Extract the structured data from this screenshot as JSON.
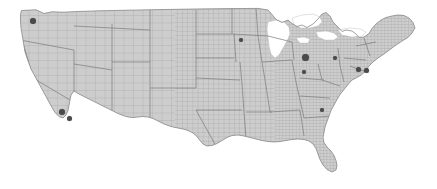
{
  "map": {
    "title": "United States county map",
    "region": "Contiguous United States",
    "background_color": "#ffffff",
    "land_fill_color": "#cccccc",
    "county_border_color": "#9a9a9a",
    "state_border_color": "#7d7d7d",
    "lake_fill_color": "#ffffff",
    "marker_color": "#4a4a4a",
    "marker_label": "city-marker",
    "units": "pixels",
    "width": 437,
    "height": 189
  },
  "chart_data": {
    "type": "scatter",
    "subtitle": "",
    "xlabel": "",
    "ylabel": "",
    "projection": "albers-usa",
    "grid": false,
    "legend": false,
    "basemap": {
      "name": "US counties",
      "fill": "#cccccc",
      "stroke": "#9a9a9a"
    },
    "point_color": "#4a4a4a",
    "points": [
      {
        "name": "Seattle",
        "state": "WA",
        "x": 33,
        "y": 21,
        "size": 6
      },
      {
        "name": "Los Angeles",
        "state": "CA",
        "x": 62,
        "y": 112,
        "size": 6
      },
      {
        "name": "San Diego",
        "state": "CA",
        "x": 69,
        "y": 118,
        "size": 5
      },
      {
        "name": "Minneapolis",
        "state": "MN",
        "x": 241,
        "y": 40,
        "size": 4
      },
      {
        "name": "Chicago",
        "state": "IL",
        "x": 305,
        "y": 57,
        "size": 7
      },
      {
        "name": "Indianapolis",
        "state": "IN",
        "x": 304,
        "y": 72,
        "size": 4
      },
      {
        "name": "Cleveland",
        "state": "OH",
        "x": 335,
        "y": 58,
        "size": 4
      },
      {
        "name": "Philadelphia",
        "state": "PA",
        "x": 358,
        "y": 69,
        "size": 5
      },
      {
        "name": "New York",
        "state": "NY",
        "x": 366,
        "y": 70,
        "size": 5
      },
      {
        "name": "Atlanta",
        "state": "GA",
        "x": 322,
        "y": 110,
        "size": 4
      }
    ]
  }
}
